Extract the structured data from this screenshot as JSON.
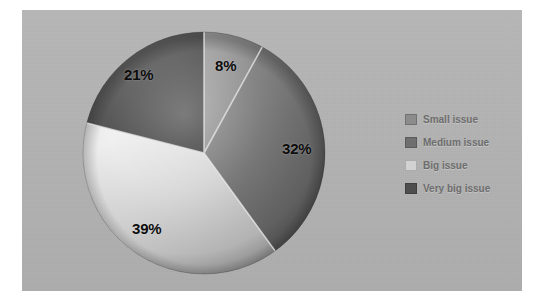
{
  "figure": {
    "panel_background": "#b2b2b2",
    "page_background": "#ffffff"
  },
  "chart_data": {
    "type": "pie",
    "title": "",
    "subtitle": "",
    "xlabel": "",
    "ylabel": "",
    "grid": false,
    "legend_position": "right",
    "value_unit": "%",
    "categories": [
      "Small issue",
      "Medium issue",
      "Big issue",
      "Very big issue"
    ],
    "values": [
      8,
      32,
      39,
      21
    ],
    "data_labels": [
      "8%",
      "32%",
      "39%",
      "21%"
    ],
    "colors": [
      "#8c8c8c",
      "#6f6f6f",
      "#d2d2d2",
      "#4e4e4e"
    ],
    "slices": [
      {
        "label": "Small issue",
        "value": 8,
        "data_label": "8%",
        "color": "#8c8c8c",
        "start_angle": 0,
        "end_angle": 28.8,
        "label_x": 134,
        "label_y": 27
      },
      {
        "label": "Medium issue",
        "value": 32,
        "data_label": "32%",
        "color": "#6f6f6f",
        "start_angle": 28.8,
        "end_angle": 144.0,
        "label_x": 201,
        "label_y": 110
      },
      {
        "label": "Big issue",
        "value": 39,
        "data_label": "39%",
        "color": "#d2d2d2",
        "start_angle": 144.0,
        "end_angle": 284.4,
        "label_x": 51,
        "label_y": 190
      },
      {
        "label": "Very big issue",
        "value": 21,
        "data_label": "21%",
        "color": "#4e4e4e",
        "start_angle": 284.4,
        "end_angle": 360,
        "label_x": 43,
        "label_y": 36
      }
    ]
  },
  "legend": {
    "items": [
      {
        "label": "Small issue",
        "color": "#8c8c8c"
      },
      {
        "label": "Medium issue",
        "color": "#6f6f6f"
      },
      {
        "label": "Big issue",
        "color": "#d2d2d2"
      },
      {
        "label": "Very big issue",
        "color": "#4e4e4e"
      }
    ]
  }
}
